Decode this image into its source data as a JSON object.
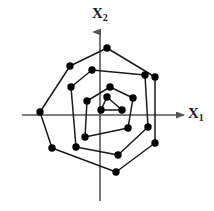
{
  "figure": {
    "title": "",
    "background_color": "#ffffff",
    "line_color": "#1a1a1a",
    "marker_color": "#000000",
    "axis_color": "#555555",
    "width": 214,
    "height": 211
  },
  "axes": {
    "x_axis": {
      "label_text": "X",
      "label_sub": "1",
      "name": "X1",
      "orientation": "horizontal",
      "origin_pixel_y": 115,
      "start_pixel_x": 22,
      "end_pixel_x": 186,
      "arrow": "right"
    },
    "y_axis": {
      "label_text": "X",
      "label_sub": "2",
      "name": "X2",
      "orientation": "vertical",
      "origin_pixel_x": 100,
      "start_pixel_y": 201,
      "end_pixel_y": 30,
      "arrow": "up"
    },
    "origin": [
      100,
      115
    ]
  },
  "chart_data": {
    "type": "scatter",
    "title": "",
    "xlabel": "X1",
    "ylabel": "X2",
    "grid": false,
    "legend": "none",
    "xlim": [
      -80,
      90
    ],
    "ylim": [
      -90,
      70
    ],
    "series": [
      {
        "name": "outer-contour",
        "closed": true,
        "marker": "filled-circle",
        "marker_size": 5,
        "points_pixel": [
          [
            107,
            48
          ],
          [
            155,
            77
          ],
          [
            155,
            143
          ],
          [
            116,
            172
          ],
          [
            52,
            148
          ],
          [
            40,
            112
          ],
          [
            70,
            66
          ]
        ],
        "points": [
          [
            7,
            67
          ],
          [
            55,
            38
          ],
          [
            55,
            -28
          ],
          [
            16,
            -57
          ],
          [
            -48,
            -33
          ],
          [
            -60,
            3
          ],
          [
            -30,
            49
          ]
        ]
      },
      {
        "name": "middle-contour",
        "closed": true,
        "marker": "filled-circle",
        "marker_size": 5,
        "points_pixel": [
          [
            92,
            70
          ],
          [
            145,
            75
          ],
          [
            148,
            127
          ],
          [
            118,
            155
          ],
          [
            76,
            147
          ],
          [
            71,
            87
          ]
        ],
        "points": [
          [
            -8,
            45
          ],
          [
            45,
            40
          ],
          [
            48,
            -12
          ],
          [
            18,
            -40
          ],
          [
            -24,
            -32
          ],
          [
            -29,
            28
          ]
        ]
      },
      {
        "name": "inner-contour",
        "closed": true,
        "marker": "filled-circle",
        "marker_size": 5,
        "points_pixel": [
          [
            110,
            87
          ],
          [
            133,
            98
          ],
          [
            128,
            128
          ],
          [
            85,
            137
          ],
          [
            87,
            101
          ]
        ],
        "points": [
          [
            10,
            28
          ],
          [
            33,
            17
          ],
          [
            28,
            -13
          ],
          [
            -15,
            -22
          ],
          [
            -13,
            14
          ]
        ]
      },
      {
        "name": "innermost-triangle",
        "closed": true,
        "marker": "filled-circle",
        "marker_size": 5,
        "points_pixel": [
          [
            107,
            97
          ],
          [
            122,
            110
          ],
          [
            101,
            110
          ]
        ],
        "points": [
          [
            7,
            18
          ],
          [
            22,
            5
          ],
          [
            1,
            5
          ]
        ]
      }
    ]
  }
}
